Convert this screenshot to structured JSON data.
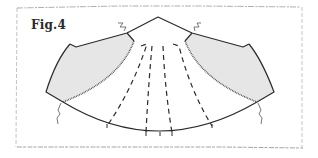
{
  "figure": {
    "label": "Fig.4",
    "colors": {
      "outline": "#2b2b2b",
      "shading": "#e6e6e6",
      "frame": "#9a9a9a",
      "background": "#ffffff"
    },
    "elements": {
      "shaded_panels": 2,
      "dashed_slash_lines": 4,
      "zigzag_break_marks": 4,
      "serrated_hem_edges": 2
    }
  }
}
